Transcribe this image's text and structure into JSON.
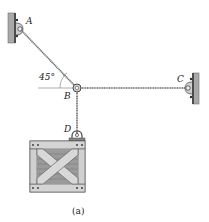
{
  "figure": {
    "caption": "(a)",
    "points": {
      "A": "A",
      "B": "B",
      "C": "C",
      "D": "D"
    },
    "angle_label": "45°"
  },
  "colors": {
    "wall": "#a9a9a9",
    "wall_edge": "#6f6f6f",
    "rope": "#6a6a6a",
    "crate_frame": "#c8c8c8",
    "crate_dark": "#7a7a7a",
    "crate_board": "#e0e0e0",
    "text": "#222222"
  }
}
